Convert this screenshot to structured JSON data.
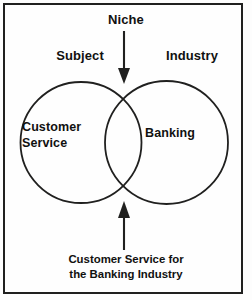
{
  "figure": {
    "type": "venn-diagram",
    "title_label": "Niche",
    "left_set_header": "Subject",
    "right_set_header": "Industry",
    "left_set_label_line1": "Customer",
    "left_set_label_line2": "Service",
    "right_set_label": "Banking",
    "caption_line1": "Customer Service for",
    "caption_line2": "the Banking Industry",
    "colors": {
      "stroke": "#20201f",
      "text": "#111110",
      "background": "#fefefe",
      "border": "#20201f"
    },
    "arrows": {
      "top": {
        "name": "niche-arrow-down",
        "direction": "down",
        "points_to": "upper-intersection"
      },
      "bottom": {
        "name": "caption-arrow-up",
        "direction": "up",
        "points_to": "lower-intersection"
      }
    }
  }
}
